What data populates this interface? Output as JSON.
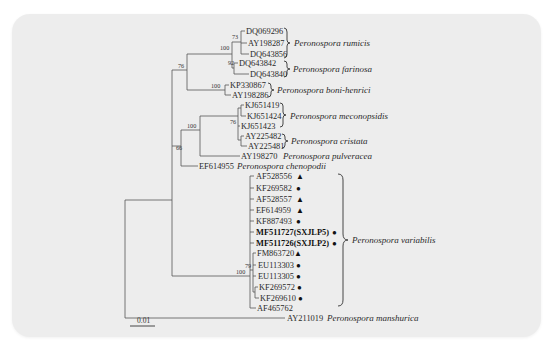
{
  "figure": {
    "type": "phylogenetic-tree",
    "scale_bar": "0.01",
    "taxa": [
      {
        "id": "DQ069296",
        "marker": ""
      },
      {
        "id": "AY198287",
        "marker": ""
      },
      {
        "id": "DQ643856",
        "marker": ""
      },
      {
        "id": "DQ643842",
        "marker": ""
      },
      {
        "id": "DQ643840",
        "marker": ""
      },
      {
        "id": "KP330867",
        "marker": ""
      },
      {
        "id": "AY198286",
        "marker": ""
      },
      {
        "id": "KJ651419",
        "marker": ""
      },
      {
        "id": "KJ651424",
        "marker": ""
      },
      {
        "id": "KJ651423",
        "marker": ""
      },
      {
        "id": "AY225482",
        "marker": ""
      },
      {
        "id": "AY225481",
        "marker": ""
      },
      {
        "id": "AY198270",
        "marker": ""
      },
      {
        "id": "EF614955",
        "marker": ""
      },
      {
        "id": "AF528556",
        "marker": "▲"
      },
      {
        "id": "KF269582",
        "marker": "●"
      },
      {
        "id": "AF528557",
        "marker": "▲"
      },
      {
        "id": "EF614959",
        "marker": "▲"
      },
      {
        "id": "KF887493",
        "marker": "●"
      },
      {
        "id": "MF511727(SXJLP5)",
        "marker": "●",
        "bold": true
      },
      {
        "id": "MF511726(SXJLP2)",
        "marker": "●",
        "bold": true
      },
      {
        "id": "FM863720",
        "marker": "▲"
      },
      {
        "id": "EU113303",
        "marker": "●"
      },
      {
        "id": "EU113305",
        "marker": "●"
      },
      {
        "id": "KF269572",
        "marker": "●"
      },
      {
        "id": "KF269610",
        "marker": "●"
      },
      {
        "id": "AF465762",
        "marker": ""
      },
      {
        "id": "AY211019",
        "marker": ""
      }
    ],
    "species": {
      "rumicis": "Peronospora rumicis",
      "farinosa": "Peronospora farinosa",
      "boni_henrici": "Peronospora boni-henrici",
      "meconopsidis": "Peronospora meconopsidis",
      "cristata": "Peronospora cristata",
      "pulveracea": "Peronospora pulveracea",
      "chenopodii": "Peronospora chenopodii",
      "variabilis": "Peronospora variabilis",
      "manshurica": "Peronospora manshurica"
    },
    "bootstrap": {
      "rumicis_inner": "73",
      "rumicis_farinosa": "100",
      "farinosa": "92",
      "boni_henrici": "100",
      "upper_clade": "76",
      "meconopsidis": "76",
      "mec_cristata": "100",
      "middle_clade": "66",
      "variabilis_inner": "79",
      "variabilis": "100"
    }
  }
}
